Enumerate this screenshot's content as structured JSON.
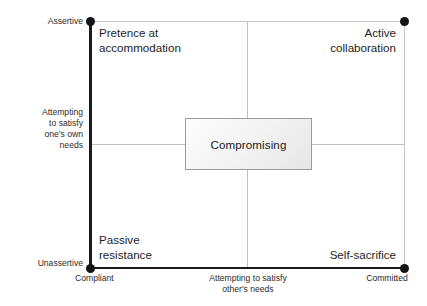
{
  "figure": {
    "background_color": "#ffffff",
    "axis_color": "#1b1b1b",
    "grid_color": "#bfbfbf",
    "border_color": "#c6c6c6",
    "box_border_color": "#9a9a9a",
    "text_color": "#1d1d1d"
  },
  "axes": {
    "y": {
      "label": "Attempting\nto satisfy\none's own\nneeds",
      "high_end_label": "Assertive",
      "low_end_label": "Unassertive"
    },
    "x": {
      "label": "Attempting to satisfy\nother's needs",
      "low_end_label": "Compliant",
      "high_end_label": "Committed"
    }
  },
  "quadrants": [
    {
      "position": "top-left",
      "label": "Pretence at\naccommodation"
    },
    {
      "position": "top-right",
      "label": "Active\ncollaboration"
    },
    {
      "position": "bottom-left",
      "label": "Passive\nresistance"
    },
    {
      "position": "bottom-right",
      "label": "Self-sacrifice"
    }
  ],
  "center_box": {
    "label": "Compromising"
  },
  "chart_data": {
    "type": "scatter",
    "title": "",
    "xlabel": "Attempting to satisfy other's needs",
    "ylabel": "Attempting to satisfy one's own needs",
    "xlim": [
      0,
      1
    ],
    "ylim": [
      0,
      1
    ],
    "xticklabels": [
      "Compliant",
      "Committed"
    ],
    "yticklabels": [
      "Unassertive",
      "Assertive"
    ],
    "grid": true,
    "legend": null,
    "points": [
      {
        "x": 0,
        "y": 1,
        "label": "Pretence at accommodation"
      },
      {
        "x": 1,
        "y": 1,
        "label": "Active collaboration"
      },
      {
        "x": 0,
        "y": 0,
        "label": "Passive resistance"
      },
      {
        "x": 1,
        "y": 0,
        "label": "Self-sacrifice"
      }
    ],
    "annotations": [
      {
        "x": 0.5,
        "y": 0.5,
        "text": "Compromising",
        "shape": "box"
      }
    ]
  }
}
